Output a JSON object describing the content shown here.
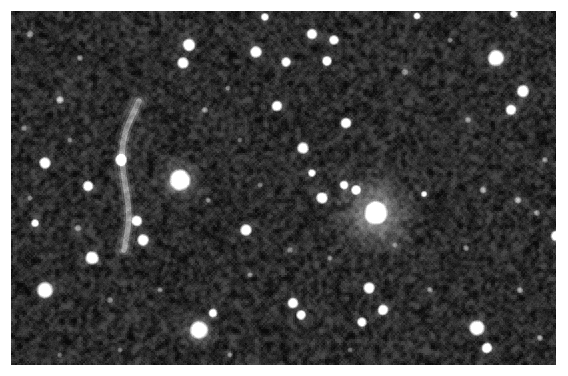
{
  "image": {
    "kind": "astronomical-ccd-field",
    "subject": "galaxy cluster star field with gravitational lensing arc",
    "width": 568,
    "height": 376,
    "background_color": "#ffffff",
    "frame": {
      "x": 11,
      "y": 11,
      "width": 545,
      "height": 354
    },
    "sky": {
      "base_color": "#0b0b0b",
      "noise_color_low": "#070707",
      "noise_color_high": "#4a4a4a",
      "star_color": "#ffffff",
      "halo_color": "#b8b8b8",
      "noise_grain_px": 2.0,
      "noise_amount": 0.55
    },
    "objects": {
      "bright_stars": [
        {
          "name": "primary-star",
          "x": 180,
          "y": 180,
          "r": 11.5,
          "b": 1.0,
          "halo": 26
        },
        {
          "name": "secondary-star-halo",
          "x": 376,
          "y": 213,
          "r": 12.5,
          "b": 1.0,
          "halo": 46
        },
        {
          "name": "lower-center-star",
          "x": 199,
          "y": 330,
          "r": 10.0,
          "b": 0.98,
          "halo": 20
        },
        {
          "name": "upper-right-star",
          "x": 496,
          "y": 58,
          "r": 9.0,
          "b": 0.97,
          "halo": 18
        },
        {
          "name": "left-mid-star",
          "x": 45,
          "y": 290,
          "r": 9.0,
          "b": 0.95,
          "halo": 17
        },
        {
          "name": "right-lower-star",
          "x": 477,
          "y": 328,
          "r": 8.5,
          "b": 0.94,
          "halo": 16
        }
      ],
      "medium_stars": [
        {
          "x": 189,
          "y": 45,
          "r": 7.0,
          "b": 0.93,
          "halo": 13
        },
        {
          "x": 183,
          "y": 63,
          "r": 6.5,
          "b": 0.9,
          "halo": 12
        },
        {
          "x": 256,
          "y": 52,
          "r": 6.5,
          "b": 0.9,
          "halo": 12
        },
        {
          "x": 286,
          "y": 62,
          "r": 5.5,
          "b": 0.84,
          "halo": 10
        },
        {
          "x": 312,
          "y": 34,
          "r": 6.0,
          "b": 0.86,
          "halo": 11
        },
        {
          "x": 334,
          "y": 40,
          "r": 5.5,
          "b": 0.84,
          "halo": 10
        },
        {
          "x": 327,
          "y": 61,
          "r": 5.5,
          "b": 0.83,
          "halo": 10
        },
        {
          "x": 523,
          "y": 91,
          "r": 7.0,
          "b": 0.92,
          "halo": 13
        },
        {
          "x": 511,
          "y": 110,
          "r": 6.0,
          "b": 0.86,
          "halo": 11
        },
        {
          "x": 45,
          "y": 163,
          "r": 6.5,
          "b": 0.89,
          "halo": 12
        },
        {
          "x": 88,
          "y": 186,
          "r": 6.0,
          "b": 0.86,
          "halo": 11
        },
        {
          "x": 35,
          "y": 223,
          "r": 4.5,
          "b": 0.76,
          "halo": 9
        },
        {
          "x": 92,
          "y": 258,
          "r": 7.5,
          "b": 0.93,
          "halo": 14
        },
        {
          "x": 121,
          "y": 160,
          "r": 6.5,
          "b": 0.9,
          "halo": 12
        },
        {
          "x": 137,
          "y": 221,
          "r": 6.0,
          "b": 0.87,
          "halo": 11
        },
        {
          "x": 143,
          "y": 240,
          "r": 6.5,
          "b": 0.89,
          "halo": 12
        },
        {
          "x": 277,
          "y": 106,
          "r": 6.0,
          "b": 0.88,
          "halo": 11
        },
        {
          "x": 346,
          "y": 123,
          "r": 6.0,
          "b": 0.86,
          "halo": 11
        },
        {
          "x": 303,
          "y": 148,
          "r": 6.5,
          "b": 0.89,
          "halo": 12
        },
        {
          "x": 312,
          "y": 173,
          "r": 4.5,
          "b": 0.74,
          "halo": 9
        },
        {
          "x": 246,
          "y": 230,
          "r": 6.5,
          "b": 0.9,
          "halo": 12
        },
        {
          "x": 322,
          "y": 198,
          "r": 6.5,
          "b": 0.9,
          "halo": 12
        },
        {
          "x": 356,
          "y": 190,
          "r": 5.5,
          "b": 0.82,
          "halo": 10
        },
        {
          "x": 344,
          "y": 185,
          "r": 5.0,
          "b": 0.8,
          "halo": 10
        },
        {
          "x": 213,
          "y": 313,
          "r": 5.0,
          "b": 0.83,
          "halo": 10
        },
        {
          "x": 293,
          "y": 303,
          "r": 6.0,
          "b": 0.88,
          "halo": 11
        },
        {
          "x": 301,
          "y": 315,
          "r": 5.5,
          "b": 0.85,
          "halo": 10
        },
        {
          "x": 369,
          "y": 288,
          "r": 6.5,
          "b": 0.9,
          "halo": 12
        },
        {
          "x": 383,
          "y": 310,
          "r": 6.0,
          "b": 0.88,
          "halo": 11
        },
        {
          "x": 362,
          "y": 322,
          "r": 5.5,
          "b": 0.85,
          "halo": 10
        },
        {
          "x": 487,
          "y": 348,
          "r": 6.0,
          "b": 0.88,
          "halo": 11
        },
        {
          "x": 556,
          "y": 236,
          "r": 6.0,
          "b": 0.9,
          "halo": 11
        },
        {
          "x": 424,
          "y": 194,
          "r": 3.5,
          "b": 0.62,
          "halo": 8
        },
        {
          "x": 265,
          "y": 17,
          "r": 4.5,
          "b": 0.78,
          "halo": 9
        },
        {
          "x": 417,
          "y": 16,
          "r": 4.0,
          "b": 0.72,
          "halo": 8
        },
        {
          "x": 514,
          "y": 14,
          "r": 4.5,
          "b": 0.76,
          "halo": 9
        }
      ],
      "faint_stars": [
        {
          "x": 30,
          "y": 34,
          "r": 4.0,
          "b": 0.34,
          "halo": 10
        },
        {
          "x": 60,
          "y": 100,
          "r": 4.5,
          "b": 0.42,
          "halo": 11
        },
        {
          "x": 80,
          "y": 58,
          "r": 3.5,
          "b": 0.3,
          "halo": 9
        },
        {
          "x": 24,
          "y": 128,
          "r": 3.5,
          "b": 0.28,
          "halo": 9
        },
        {
          "x": 70,
          "y": 140,
          "r": 3.0,
          "b": 0.26,
          "halo": 8
        },
        {
          "x": 78,
          "y": 228,
          "r": 4.0,
          "b": 0.35,
          "halo": 10
        },
        {
          "x": 30,
          "y": 198,
          "r": 3.0,
          "b": 0.24,
          "halo": 8
        },
        {
          "x": 110,
          "y": 300,
          "r": 3.5,
          "b": 0.28,
          "halo": 9
        },
        {
          "x": 160,
          "y": 290,
          "r": 3.0,
          "b": 0.25,
          "halo": 8
        },
        {
          "x": 205,
          "y": 110,
          "r": 3.5,
          "b": 0.32,
          "halo": 9
        },
        {
          "x": 228,
          "y": 88,
          "r": 3.0,
          "b": 0.26,
          "halo": 8
        },
        {
          "x": 240,
          "y": 140,
          "r": 3.0,
          "b": 0.24,
          "halo": 8
        },
        {
          "x": 208,
          "y": 200,
          "r": 3.0,
          "b": 0.25,
          "halo": 8
        },
        {
          "x": 260,
          "y": 185,
          "r": 3.0,
          "b": 0.24,
          "halo": 8
        },
        {
          "x": 290,
          "y": 250,
          "r": 3.5,
          "b": 0.28,
          "halo": 9
        },
        {
          "x": 250,
          "y": 275,
          "r": 3.0,
          "b": 0.24,
          "halo": 8
        },
        {
          "x": 330,
          "y": 258,
          "r": 3.0,
          "b": 0.25,
          "halo": 8
        },
        {
          "x": 405,
          "y": 72,
          "r": 4.0,
          "b": 0.34,
          "halo": 10
        },
        {
          "x": 450,
          "y": 40,
          "r": 3.0,
          "b": 0.26,
          "halo": 8
        },
        {
          "x": 468,
          "y": 120,
          "r": 3.5,
          "b": 0.28,
          "halo": 9
        },
        {
          "x": 483,
          "y": 190,
          "r": 4.0,
          "b": 0.4,
          "halo": 10
        },
        {
          "x": 518,
          "y": 200,
          "r": 4.0,
          "b": 0.42,
          "halo": 10
        },
        {
          "x": 537,
          "y": 213,
          "r": 3.5,
          "b": 0.33,
          "halo": 9
        },
        {
          "x": 466,
          "y": 248,
          "r": 3.5,
          "b": 0.3,
          "halo": 9
        },
        {
          "x": 430,
          "y": 290,
          "r": 3.5,
          "b": 0.3,
          "halo": 9
        },
        {
          "x": 520,
          "y": 290,
          "r": 3.5,
          "b": 0.3,
          "halo": 9
        },
        {
          "x": 540,
          "y": 338,
          "r": 3.5,
          "b": 0.32,
          "halo": 9
        },
        {
          "x": 545,
          "y": 160,
          "r": 3.5,
          "b": 0.3,
          "halo": 9
        },
        {
          "x": 395,
          "y": 245,
          "r": 3.0,
          "b": 0.24,
          "halo": 8
        },
        {
          "x": 350,
          "y": 350,
          "r": 3.0,
          "b": 0.24,
          "halo": 8
        },
        {
          "x": 230,
          "y": 355,
          "r": 3.0,
          "b": 0.24,
          "halo": 8
        },
        {
          "x": 120,
          "y": 350,
          "r": 3.0,
          "b": 0.23,
          "halo": 8
        },
        {
          "x": 60,
          "y": 355,
          "r": 3.0,
          "b": 0.23,
          "halo": 8
        }
      ],
      "lensing_arc": {
        "name": "gravitational-lensing-arc",
        "points": [
          [
            139,
            101
          ],
          [
            134,
            112
          ],
          [
            128,
            124
          ],
          [
            124,
            137
          ],
          [
            122,
            150
          ],
          [
            122,
            163
          ],
          [
            124,
            176
          ],
          [
            126,
            189
          ],
          [
            128,
            202
          ],
          [
            129,
            215
          ],
          [
            128,
            228
          ],
          [
            126,
            240
          ],
          [
            124,
            250
          ]
        ],
        "width": 6.5,
        "brightness": 0.52,
        "color": "#9a9a9a"
      },
      "diffuse_glow": [
        {
          "name": "cluster-glow-right",
          "x": 376,
          "y": 213,
          "r": 62,
          "b": 0.2
        },
        {
          "name": "cluster-glow-center",
          "x": 180,
          "y": 180,
          "r": 34,
          "b": 0.14
        },
        {
          "name": "nebulous-patch-upper-left",
          "x": 68,
          "y": 92,
          "r": 30,
          "b": 0.1
        },
        {
          "name": "nebulous-patch-lower",
          "x": 200,
          "y": 330,
          "r": 28,
          "b": 0.1
        }
      ]
    }
  }
}
